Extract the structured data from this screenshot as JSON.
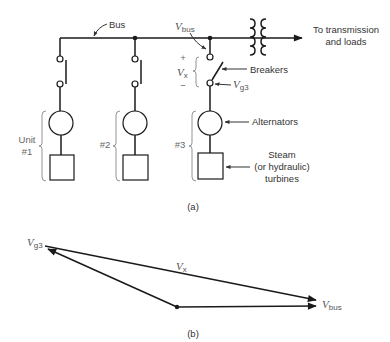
{
  "part_a": {
    "caption": "(a)",
    "bus_label": "Bus",
    "vbus_label": {
      "main": "V",
      "sub": "bus"
    },
    "vx_label": {
      "main": "V",
      "sub": "x"
    },
    "vg3_label": {
      "main": "V",
      "sub": "g3"
    },
    "plus": "+",
    "minus": "−",
    "destination_label": [
      "To transmission",
      "and loads"
    ],
    "breakers_label": "Breakers",
    "alternators_label": "Alternators",
    "turbines_label": [
      "Steam",
      "(or hydraulic)",
      "turbines"
    ],
    "units": [
      {
        "label": [
          "Unit",
          "#1"
        ]
      },
      {
        "label": [
          "#2"
        ]
      },
      {
        "label": [
          "#3"
        ]
      }
    ]
  },
  "part_b": {
    "caption": "(b)",
    "vg3_label": {
      "main": "V",
      "sub": "g3"
    },
    "vx_label": {
      "main": "V",
      "sub": "x"
    },
    "vbus_label": {
      "main": "V",
      "sub": "bus"
    }
  }
}
